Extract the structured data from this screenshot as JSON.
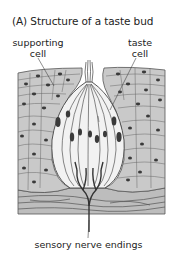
{
  "figure": {
    "title": "(A)  Structure of a taste bud",
    "labels": {
      "supporting_cell": [
        "supporting",
        "cell"
      ],
      "taste_cell": [
        "taste",
        "cell"
      ],
      "nerve": "sensory nerve endings"
    },
    "colors": {
      "epithelium": "#c9c9c9",
      "cell_outline": "#555555",
      "nucleus": "#3a3a3a",
      "bud_fill": "#f2f2f2",
      "connective": "#bdbdbd",
      "nerve": "#333333"
    }
  }
}
